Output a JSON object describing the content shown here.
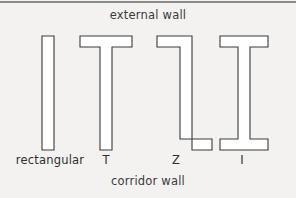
{
  "figure": {
    "title_top": "external wall",
    "title_bottom": "corridor wall",
    "background_color": "#f3f2f0",
    "stroke_color": "#3a3a3a",
    "fill_color": "#ffffff"
  },
  "labels": {
    "rectangular": "rectangular",
    "t": "T",
    "z": "Z",
    "i": "I"
  },
  "chart_data": {
    "type": "diagram",
    "annotations": [
      "external wall",
      "corridor wall"
    ],
    "categories": [
      "rectangular",
      "T",
      "Z",
      "I"
    ],
    "shapes": [
      {
        "name": "rectangular",
        "label": "rectangular",
        "description": "Plain vertical rectangular bar, no flanges",
        "points": "42,36 54,36 54,150 42,150"
      },
      {
        "name": "t-shape",
        "label": "T",
        "description": "Top flange full width, vertical web descending from center",
        "points": "80,36 132,36 132,47 112,47 112,150 100,150 100,47 80,47"
      },
      {
        "name": "z-shape",
        "label": "Z",
        "description": "Top flange extends left, bottom flange extends right, offset web",
        "points": "157,36 192,36 192,150 212,150 212,139 180,139 180,47 157,47"
      },
      {
        "name": "i-shape",
        "label": "I",
        "description": "Top and bottom flanges of equal width joined by central web",
        "points": "220,36 268,36 268,47 250,47 250,139 268,139 268,150 220,150 220,139 238,139 238,47 220,47"
      }
    ]
  }
}
